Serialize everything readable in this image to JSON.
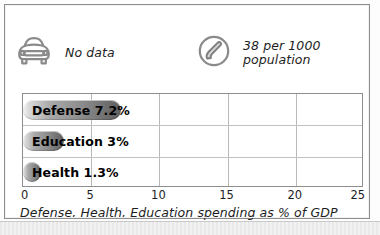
{
  "legend": {
    "items": [
      {
        "icon": "car-icon",
        "label": "No data"
      },
      {
        "icon": "telephone-icon",
        "label": "38 per 1000\npopulation"
      }
    ]
  },
  "chart_data": {
    "type": "bar",
    "orientation": "horizontal",
    "title": "",
    "caption": "Defense, Health, Education spending as % of GDP",
    "xlabel": "",
    "ylabel": "",
    "xlim": [
      0,
      25
    ],
    "grid": true,
    "legend_position": "none",
    "categories": [
      "Defense",
      "Education",
      "Health"
    ],
    "values": [
      7.2,
      3,
      1.3
    ],
    "tick_labels": [
      "0",
      "5",
      "10",
      "15",
      "20",
      "25"
    ],
    "ticks": [
      0,
      5,
      10,
      15,
      20,
      25
    ],
    "bar_labels": [
      "Defense 7.2%",
      "Education 3%",
      "Health 1.3%"
    ],
    "bar_color": "#8c8c8c"
  }
}
